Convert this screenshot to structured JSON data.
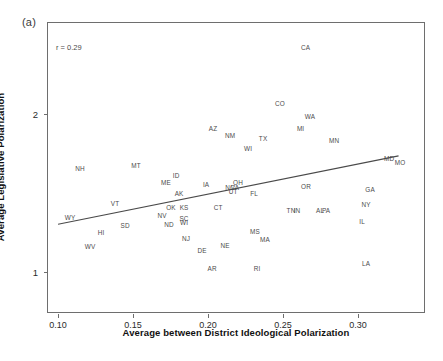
{
  "figure": {
    "panel_label": "(a)",
    "annotation": "r = 0.29"
  },
  "chart_data": {
    "type": "scatter",
    "title": "",
    "subtitle": "",
    "xlabel": "Average between District Ideological Polarization",
    "ylabel": "Average Legislative Polarization",
    "xlim": [
      0.0933,
      0.3453
    ],
    "ylim": [
      0.735,
      2.575
    ],
    "xticks": [
      0.1,
      0.15,
      0.2,
      0.25,
      0.3
    ],
    "xticklabels": [
      "0.10",
      "0.15",
      "0.20",
      "0.25",
      "0.30"
    ],
    "yticks": [
      1,
      2
    ],
    "yticklabels": [
      "1",
      "2"
    ],
    "grid": false,
    "legend": null,
    "point_style": "text-label",
    "annotations": [
      {
        "text": "r = 0.29",
        "x": 0.1,
        "y": 2.4
      }
    ],
    "trendline": {
      "type": "linear-fit",
      "x_start": 0.1,
      "y_start": 1.302,
      "x_end": 0.327,
      "y_end": 1.735,
      "slope": 1.907,
      "intercept": 1.111,
      "correlation": 0.29
    },
    "points": [
      {
        "label": "CA",
        "x": 0.265,
        "y": 2.416
      },
      {
        "label": "CO",
        "x": 0.248,
        "y": 2.062
      },
      {
        "label": "WA",
        "x": 0.268,
        "y": 1.982
      },
      {
        "label": "AZ",
        "x": 0.2033,
        "y": 1.902
      },
      {
        "label": "MI",
        "x": 0.2617,
        "y": 1.902
      },
      {
        "label": "NM",
        "x": 0.2147,
        "y": 1.858
      },
      {
        "label": "TX",
        "x": 0.2367,
        "y": 1.84
      },
      {
        "label": "MN",
        "x": 0.284,
        "y": 1.831
      },
      {
        "label": "WI",
        "x": 0.2267,
        "y": 1.778
      },
      {
        "label": "MD",
        "x": 0.3207,
        "y": 1.716
      },
      {
        "label": "MO",
        "x": 0.328,
        "y": 1.689
      },
      {
        "label": "NH",
        "x": 0.1147,
        "y": 1.654
      },
      {
        "label": "MT",
        "x": 0.152,
        "y": 1.672
      },
      {
        "label": "ID",
        "x": 0.1787,
        "y": 1.61
      },
      {
        "label": "ME",
        "x": 0.172,
        "y": 1.566
      },
      {
        "label": "OH",
        "x": 0.22,
        "y": 1.566
      },
      {
        "label": "IA",
        "x": 0.1987,
        "y": 1.548
      },
      {
        "label": "OR",
        "x": 0.2653,
        "y": 1.539
      },
      {
        "label": "GA",
        "x": 0.308,
        "y": 1.522
      },
      {
        "label": "NC",
        "x": 0.2147,
        "y": 1.531
      },
      {
        "label": "VA",
        "x": 0.218,
        "y": 1.531
      },
      {
        "label": "UT",
        "x": 0.2167,
        "y": 1.504
      },
      {
        "label": "FL",
        "x": 0.2307,
        "y": 1.495
      },
      {
        "label": "AK",
        "x": 0.1807,
        "y": 1.495
      },
      {
        "label": "VT",
        "x": 0.138,
        "y": 1.433
      },
      {
        "label": "NY",
        "x": 0.3053,
        "y": 1.424
      },
      {
        "label": "CT",
        "x": 0.2067,
        "y": 1.406
      },
      {
        "label": "KS",
        "x": 0.184,
        "y": 1.406
      },
      {
        "label": "OK",
        "x": 0.1753,
        "y": 1.406
      },
      {
        "label": "TN",
        "x": 0.2553,
        "y": 1.388
      },
      {
        "label": "IN",
        "x": 0.2593,
        "y": 1.388
      },
      {
        "label": "AL",
        "x": 0.2747,
        "y": 1.388
      },
      {
        "label": "PA",
        "x": 0.2787,
        "y": 1.388
      },
      {
        "label": "WY",
        "x": 0.108,
        "y": 1.344
      },
      {
        "label": "NV",
        "x": 0.1693,
        "y": 1.353
      },
      {
        "label": "IL",
        "x": 0.3027,
        "y": 1.318
      },
      {
        "label": "SC",
        "x": 0.184,
        "y": 1.335
      },
      {
        "label": "WI",
        "x": 0.184,
        "y": 1.309
      },
      {
        "label": "ND",
        "x": 0.174,
        "y": 1.3
      },
      {
        "label": "SD",
        "x": 0.1447,
        "y": 1.292
      },
      {
        "label": "MS",
        "x": 0.2313,
        "y": 1.256
      },
      {
        "label": "HI",
        "x": 0.1287,
        "y": 1.247
      },
      {
        "label": "NJ",
        "x": 0.1853,
        "y": 1.212
      },
      {
        "label": "MA",
        "x": 0.238,
        "y": 1.203
      },
      {
        "label": "WV",
        "x": 0.1213,
        "y": 1.159
      },
      {
        "label": "NE",
        "x": 0.2113,
        "y": 1.168
      },
      {
        "label": "DE",
        "x": 0.196,
        "y": 1.132
      },
      {
        "label": "LA",
        "x": 0.3053,
        "y": 1.053
      },
      {
        "label": "AR",
        "x": 0.2027,
        "y": 1.018
      },
      {
        "label": "RI",
        "x": 0.2327,
        "y": 1.018
      }
    ]
  }
}
